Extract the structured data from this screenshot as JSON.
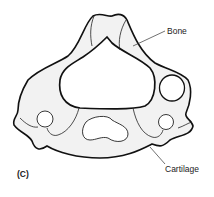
{
  "figure": {
    "panel_label": "(C)",
    "labels": [
      {
        "id": "bone",
        "text": "Bone"
      },
      {
        "id": "cartilage",
        "text": "Cartilage"
      }
    ],
    "colors": {
      "outline": "#111111",
      "fill": "#f2f2f2",
      "background": "#ffffff"
    }
  }
}
